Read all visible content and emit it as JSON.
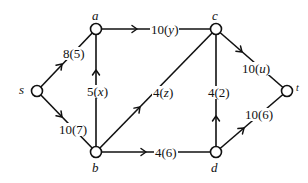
{
  "diagram": {
    "type": "flow-network",
    "nodes": [
      {
        "id": "s",
        "label": "s",
        "x": 37,
        "y": 91
      },
      {
        "id": "a",
        "label": "a",
        "x": 96,
        "y": 29
      },
      {
        "id": "c",
        "label": "c",
        "x": 216,
        "y": 29
      },
      {
        "id": "b",
        "label": "b",
        "x": 96,
        "y": 152
      },
      {
        "id": "d",
        "label": "d",
        "x": 216,
        "y": 152
      },
      {
        "id": "t",
        "label": "t",
        "x": 287,
        "y": 91
      }
    ],
    "edges": [
      {
        "id": "s-a",
        "from": "s",
        "to": "a",
        "capacity": "8",
        "flow": "5",
        "label": "8(5)"
      },
      {
        "id": "s-b",
        "from": "s",
        "to": "b",
        "capacity": "10",
        "flow": "7",
        "label": "10(7)"
      },
      {
        "id": "b-a",
        "from": "b",
        "to": "a",
        "capacity": "5",
        "flow": "x",
        "label": "5(x)"
      },
      {
        "id": "a-c",
        "from": "a",
        "to": "c",
        "capacity": "10",
        "flow": "y",
        "label": "10(y)"
      },
      {
        "id": "b-c",
        "from": "b",
        "to": "c",
        "capacity": "4",
        "flow": "z",
        "label": "4(z)"
      },
      {
        "id": "b-d",
        "from": "b",
        "to": "d",
        "capacity": "4",
        "flow": "6",
        "label": "4(6)"
      },
      {
        "id": "d-c",
        "from": "d",
        "to": "c",
        "capacity": "4",
        "flow": "2",
        "label": "4(2)"
      },
      {
        "id": "c-t",
        "from": "c",
        "to": "t",
        "capacity": "10",
        "flow": "u",
        "label": "10(u)"
      },
      {
        "id": "d-t",
        "from": "d",
        "to": "t",
        "capacity": "10",
        "flow": "6",
        "label": "10(6)"
      }
    ]
  },
  "labels": {
    "nodes": {
      "s": "s",
      "a": "a",
      "b": "b",
      "c": "c",
      "d": "d",
      "t": "t"
    },
    "edges": {
      "s_a": {
        "cap": "8",
        "flow": "5"
      },
      "s_b": {
        "cap": "10",
        "flow": "7"
      },
      "b_a": {
        "cap": "5",
        "flow": "x"
      },
      "a_c": {
        "cap": "10",
        "flow": "y"
      },
      "b_c": {
        "cap": "4",
        "flow": "z"
      },
      "b_d": {
        "cap": "4",
        "flow": "6"
      },
      "d_c": {
        "cap": "4",
        "flow": "2"
      },
      "c_t": {
        "cap": "10",
        "flow": "u"
      },
      "d_t": {
        "cap": "10",
        "flow": "6"
      }
    }
  },
  "colors": {
    "stroke": "#111111",
    "background": "#ffffff"
  }
}
